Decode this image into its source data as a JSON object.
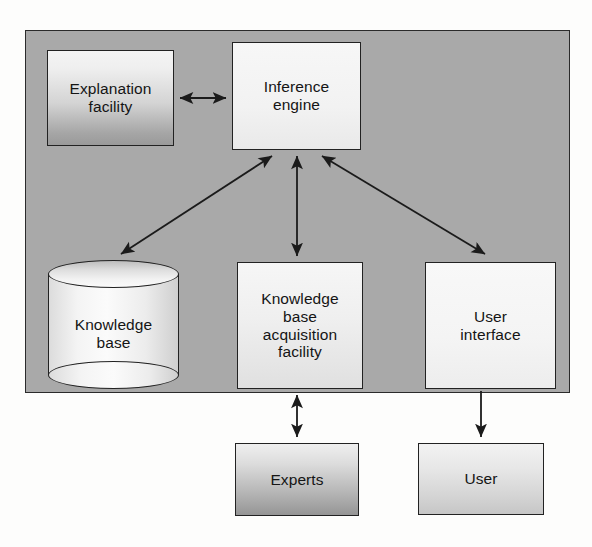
{
  "diagram": {
    "container": {
      "name": "expert-system-boundary",
      "fill": "#a9a9a9",
      "stroke": "#2b2b2b"
    },
    "background": "#fdfdfc",
    "nodes": {
      "explanation_facility": {
        "label": "Explanation\nfacility",
        "line1": "Explanation",
        "line2": "facility",
        "shape": "rectangle"
      },
      "inference_engine": {
        "label": "Inference\nengine",
        "line1": "Inference",
        "line2": "engine",
        "shape": "rectangle"
      },
      "knowledge_base": {
        "label": "Knowledge\nbase",
        "line1": "Knowledge",
        "line2": "base",
        "shape": "cylinder"
      },
      "kb_acquisition_facility": {
        "label": "Knowledge base acquisition facility",
        "line1": "Knowledge",
        "line2": "base",
        "line3": "acquisition",
        "line4": "facility",
        "shape": "rectangle"
      },
      "user_interface": {
        "label": "User\ninterface",
        "line1": "User",
        "line2": "interface",
        "shape": "rectangle"
      },
      "experts": {
        "label": "Experts",
        "line1": "Experts",
        "shape": "rectangle"
      },
      "user": {
        "label": "User",
        "line1": "User",
        "shape": "rectangle"
      }
    },
    "edges": [
      {
        "from": "explanation_facility",
        "to": "inference_engine",
        "direction": "bidirectional"
      },
      {
        "from": "inference_engine",
        "to": "knowledge_base",
        "direction": "bidirectional"
      },
      {
        "from": "inference_engine",
        "to": "kb_acquisition_facility",
        "direction": "bidirectional"
      },
      {
        "from": "inference_engine",
        "to": "user_interface",
        "direction": "bidirectional"
      },
      {
        "from": "kb_acquisition_facility",
        "to": "experts",
        "direction": "bidirectional"
      },
      {
        "from": "user_interface",
        "to": "user",
        "direction": "unidirectional"
      }
    ]
  }
}
